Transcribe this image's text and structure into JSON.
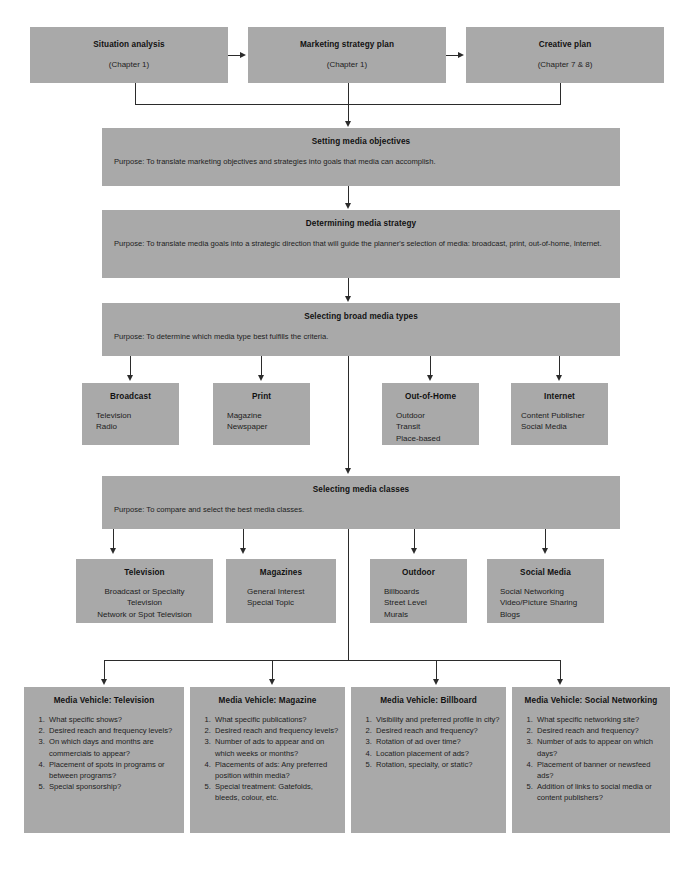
{
  "diagram": {
    "colors": {
      "box_fill": "#a9a9a9",
      "connector": "#2b2b2b",
      "page_background": "#ffffff",
      "text": "#1a1a1a"
    },
    "top_row": [
      {
        "title": "Situation analysis",
        "subtitle": "(Chapter 1)"
      },
      {
        "title": "Marketing strategy plan",
        "subtitle": "(Chapter 1)"
      },
      {
        "title": "Creative plan",
        "subtitle": "(Chapter 7 & 8)"
      }
    ],
    "stages": [
      {
        "id": "objectives",
        "title": "Setting media objectives",
        "purpose": "Purpose: To translate marketing objectives and strategies into goals that media can accomplish."
      },
      {
        "id": "strategy",
        "title": "Determining media strategy",
        "purpose": "Purpose: To translate media goals into a strategic direction that will guide the planner's selection of media: broadcast, print, out-of-home, Internet."
      },
      {
        "id": "broad_types",
        "title": "Selecting broad media types",
        "purpose": "Purpose: To determine which media type best fulfills the criteria."
      },
      {
        "id": "media_classes",
        "title": "Selecting media classes",
        "purpose": "Purpose: To compare and select the best media classes."
      }
    ],
    "broad_media_types": [
      {
        "title": "Broadcast",
        "items": [
          "Television",
          "Radio"
        ]
      },
      {
        "title": "Print",
        "items": [
          "Magazine",
          "Newspaper"
        ]
      },
      {
        "title": "Out-of-Home",
        "items": [
          "Outdoor",
          "Transit",
          "Place-based"
        ]
      },
      {
        "title": "Internet",
        "items": [
          "Content Publisher",
          "Social Media"
        ]
      }
    ],
    "media_classes": [
      {
        "title": "Television",
        "items": [
          "Broadcast or Specialty",
          "Television",
          "Network or Spot Television"
        ]
      },
      {
        "title": "Magazines",
        "items": [
          "General Interest",
          "Special Topic"
        ]
      },
      {
        "title": "Outdoor",
        "items": [
          "Billboards",
          "Street Level",
          "Murals"
        ]
      },
      {
        "title": "Social Media",
        "items": [
          "Social Networking",
          "Video/Picture Sharing",
          "Blogs"
        ]
      }
    ],
    "media_vehicles": [
      {
        "title": "Media Vehicle: Television",
        "questions": [
          "What specific shows?",
          "Desired reach and frequency levels?",
          "On which days and months are commercials to appear?",
          "Placement of spots in programs or between programs?",
          "Special sponsorship?"
        ]
      },
      {
        "title": "Media Vehicle: Magazine",
        "questions": [
          "What specific publications?",
          "Desired reach and frequency levels?",
          "Number of ads to appear and on which weeks or months?",
          "Placements of ads: Any preferred position within media?",
          "Special treatment: Gatefolds, bleeds, colour, etc."
        ]
      },
      {
        "title": "Media Vehicle: Billboard",
        "questions": [
          "Visibility and preferred profile in city?",
          "Desired reach and frequency?",
          "Rotation of ad over time?",
          "Location placement of ads?",
          "Rotation, specialty, or static?"
        ]
      },
      {
        "title": "Media Vehicle: Social Networking",
        "questions": [
          "What specific networking site?",
          "Desired reach and frequency?",
          "Number of ads to appear on which days?",
          "Placement of banner or newsfeed ads?",
          "Addition of links to social media or content publishers?"
        ]
      }
    ]
  }
}
